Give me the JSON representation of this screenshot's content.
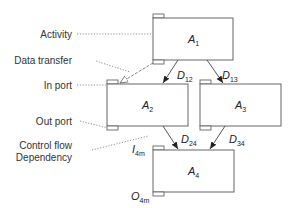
{
  "legend": {
    "activity": "Activity",
    "data_transfer": "Data transfer",
    "in_port": "In port",
    "out_port": "Out port",
    "control_flow_line1": "Control flow",
    "control_flow_line2": "Dependency"
  },
  "activities": [
    {
      "id": "A1",
      "base": "A",
      "sub": "1"
    },
    {
      "id": "A2",
      "base": "A",
      "sub": "2"
    },
    {
      "id": "A3",
      "base": "A",
      "sub": "3"
    },
    {
      "id": "A4",
      "base": "A",
      "sub": "4"
    }
  ],
  "edges": [
    {
      "id": "D12",
      "base": "D",
      "sub": "12",
      "from": "A1",
      "to": "A2"
    },
    {
      "id": "D13",
      "base": "D",
      "sub": "13",
      "from": "A1",
      "to": "A3"
    },
    {
      "id": "D24",
      "base": "D",
      "sub": "24",
      "from": "A2",
      "to": "A4"
    },
    {
      "id": "D34",
      "base": "D",
      "sub": "34",
      "from": "A3",
      "to": "A4"
    }
  ],
  "ports": {
    "in_a4": {
      "base": "I",
      "sub": "4m"
    },
    "out_a4": {
      "base": "O",
      "sub": "4m"
    }
  },
  "colors": {
    "stroke": "#666666",
    "text": "#333333",
    "background": "#ffffff"
  }
}
